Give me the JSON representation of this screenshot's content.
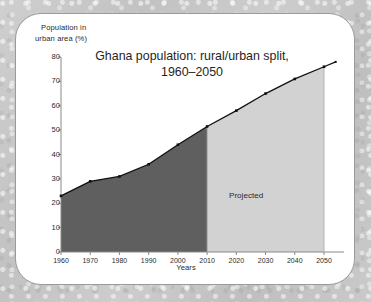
{
  "chart_data": {
    "type": "area",
    "title": "Ghana population: rural/urban split,\n1960–2050",
    "title_lines": [
      "Ghana population: rural/urban split,",
      "1960–2050"
    ],
    "xlabel": "Years",
    "ylabel": "Population in urban area (%)",
    "ylabel_lines": [
      "Population in",
      "urban area (%)"
    ],
    "xlim": [
      1960,
      2055
    ],
    "ylim": [
      0,
      80
    ],
    "ytick_labels": [
      "0",
      "10",
      "20",
      "30",
      "40",
      "50",
      "60",
      "70",
      "80"
    ],
    "yticks": [
      0,
      10,
      20,
      30,
      40,
      50,
      60,
      70,
      80
    ],
    "xtick_labels": [
      "1960",
      "1970",
      "1980",
      "1990",
      "2000",
      "2010",
      "2020",
      "2030",
      "2040",
      "2050"
    ],
    "xticks": [
      1960,
      1970,
      1980,
      1990,
      2000,
      2010,
      2020,
      2030,
      2040,
      2050
    ],
    "grid": false,
    "legend": "none",
    "x": [
      1960,
      1970,
      1980,
      1990,
      2000,
      2010,
      2020,
      2030,
      2040,
      2050,
      2054
    ],
    "values": [
      23,
      29,
      31,
      36,
      44,
      51.5,
      58,
      65,
      71,
      76,
      78
    ],
    "series": [
      {
        "name": "Population in urban area (%)",
        "x": [
          1960,
          1970,
          1980,
          1990,
          2000,
          2010,
          2020,
          2030,
          2040,
          2050,
          2054
        ],
        "values": [
          23,
          29,
          31,
          36,
          44,
          51.5,
          58,
          65,
          71,
          76,
          78
        ]
      }
    ],
    "regions": [
      {
        "name": "observed",
        "x_start": 1960,
        "x_end": 2010,
        "color": "#5f5f5f",
        "label": ""
      },
      {
        "name": "projected",
        "x_start": 2010,
        "x_end": 2050,
        "color": "#d2d2d2",
        "label": "Projected"
      }
    ],
    "annotations": [
      {
        "text": "Projected",
        "x": 2030,
        "y": 27
      }
    ],
    "colors": {
      "observed_fill": "#5f5f5f",
      "projected_fill": "#d2d2d2",
      "line": "#101010",
      "marker": "#101010",
      "axis": "#8a8a8a",
      "text": "#2a2a2a",
      "card_background": "#ffffff",
      "card_border": "#9a9a9a",
      "page_background": "#c6c6c6"
    }
  }
}
